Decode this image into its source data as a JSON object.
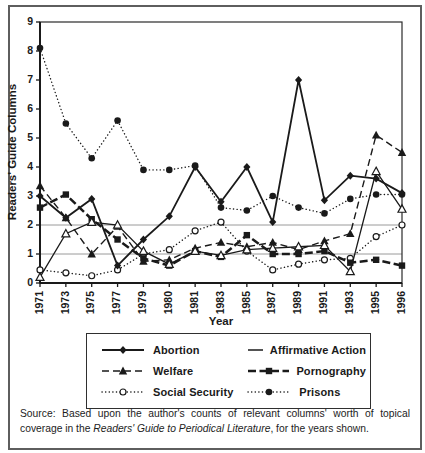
{
  "figure": {
    "source_note": {
      "prefix": "Source: Based upon the author's counts of relevant columns' worth of topical coverage in the ",
      "italic": "Readers' Guide to Periodical Literature",
      "suffix": ", for the years shown."
    }
  },
  "chart_data": {
    "type": "line",
    "xlabel": "Year",
    "ylabel": "Readers' Guide Columns",
    "x": [
      "1971",
      "1973",
      "1975",
      "1977",
      "1979",
      "1980",
      "1981",
      "1983",
      "1985",
      "1987",
      "1989",
      "1991",
      "1993",
      "1995",
      "1996"
    ],
    "ylim": [
      0,
      9
    ],
    "y_ticks": [
      0,
      1,
      2,
      3,
      4,
      5,
      6,
      7,
      8,
      9
    ],
    "gridlines_y": [
      1,
      2
    ],
    "grid": "partial-horizontal",
    "legend_position": "bottom-boxed",
    "colors": {
      "ink": "#1a1a1a",
      "grid": "#9a9a9a",
      "frame": "#2a2a2a",
      "background": "#ffffff"
    },
    "series": [
      {
        "name": "Abortion",
        "marker": "filled-diamond",
        "line": "solid",
        "values": [
          3.0,
          2.25,
          2.9,
          0.6,
          1.5,
          2.3,
          4.0,
          2.8,
          4.0,
          2.1,
          7.0,
          2.85,
          3.7,
          3.6,
          3.1
        ]
      },
      {
        "name": "Affirmative Action",
        "marker": "open-triangle",
        "line": "solid-thin",
        "values": [
          0.2,
          1.7,
          2.1,
          2.0,
          1.1,
          0.65,
          1.1,
          0.95,
          1.15,
          1.2,
          1.25,
          1.3,
          0.4,
          3.85,
          2.55
        ]
      },
      {
        "name": "Welfare",
        "marker": "filled-triangle",
        "line": "dashed",
        "values": [
          3.35,
          2.25,
          1.0,
          1.95,
          0.75,
          0.8,
          1.2,
          1.4,
          1.25,
          1.4,
          1.15,
          1.45,
          1.7,
          5.1,
          4.5
        ]
      },
      {
        "name": "Pornography",
        "marker": "filled-square",
        "line": "dashed-thick",
        "values": [
          2.6,
          3.05,
          2.2,
          1.5,
          0.85,
          0.6,
          1.1,
          0.9,
          1.65,
          1.0,
          1.0,
          1.1,
          0.7,
          0.8,
          0.6
        ]
      },
      {
        "name": "Social Security",
        "marker": "open-circle",
        "line": "dotted",
        "values": [
          0.45,
          0.35,
          0.25,
          0.45,
          1.0,
          1.15,
          1.8,
          2.1,
          1.1,
          0.45,
          0.65,
          0.8,
          0.85,
          1.6,
          2.0
        ]
      },
      {
        "name": "Prisons",
        "marker": "filled-circle",
        "line": "dotted",
        "values": [
          8.1,
          5.5,
          4.3,
          5.6,
          3.9,
          3.9,
          4.05,
          2.6,
          2.5,
          3.0,
          2.6,
          2.4,
          2.9,
          3.05,
          3.05
        ]
      }
    ]
  }
}
